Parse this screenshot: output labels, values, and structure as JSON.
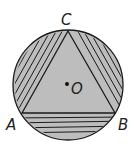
{
  "figure": {
    "labels": {
      "vertex_a": "A",
      "vertex_b": "B",
      "vertex_c": "C",
      "center": "O"
    },
    "colors": {
      "fill": "#bdbdbd",
      "stroke": "#1a1a1a",
      "background": "#ffffff"
    },
    "regions": [
      {
        "name": "triangle",
        "fill": "solid gray"
      },
      {
        "name": "segment-left (arc AC)",
        "fill": "diagonal hatch"
      },
      {
        "name": "segment-right (arc CB)",
        "fill": "diagonal hatch"
      },
      {
        "name": "segment-bottom (arc AB)",
        "fill": "horizontal hatch"
      }
    ]
  }
}
